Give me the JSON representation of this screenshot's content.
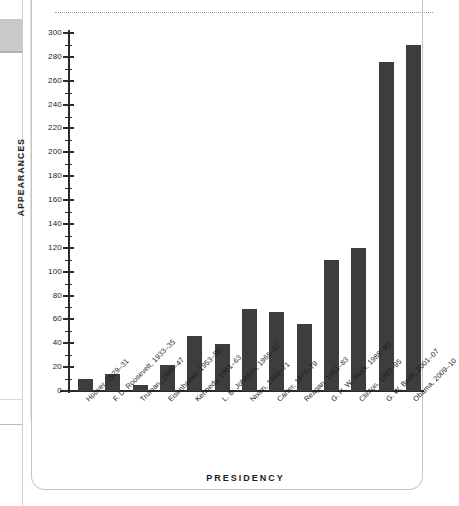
{
  "chart_data": {
    "type": "bar",
    "title": "",
    "xlabel": "PRESIDENCY",
    "ylabel": "APPEARANCES",
    "ylim": [
      0,
      300
    ],
    "ytick_step": 20,
    "yminor_step": 10,
    "grid": false,
    "legend": null,
    "bar_color": "#3d3d3d",
    "categories": [
      "Hoover, 1929–31",
      "F. D. Roosevelt, 1933–35",
      "Truman, 1945–47",
      "Eisenhower, 1953–55",
      "Kennedy, 1961–63",
      "L. B. Johnson, 1965–67",
      "Nixon, 1969–71",
      "Carter, 1977–79",
      "Reagan, 1981–83",
      "G. H. W. Bush, 1988–90",
      "Clinton, 1993–95",
      "G. W. Bush, 2001–07",
      "Obama, 2009–10"
    ],
    "values": [
      10,
      14,
      5,
      22,
      46,
      39,
      69,
      66,
      56,
      110,
      120,
      276,
      290
    ],
    "ytick_labels": [
      "0",
      "20",
      "40",
      "60",
      "80",
      "100",
      "120",
      "140",
      "160",
      "180",
      "200",
      "220",
      "240",
      "260",
      "280",
      "300"
    ]
  },
  "page": {
    "tab_label": "",
    "dotted_rule": ""
  }
}
